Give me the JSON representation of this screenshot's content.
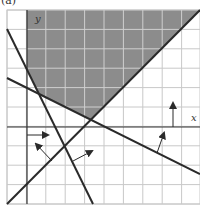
{
  "figure": {
    "panel_label": "(a)",
    "x_axis_label": "x",
    "y_axis_label": "y"
  },
  "colors": {
    "shade": "#8c8c8c",
    "grid_on_shade": "#cfcfcf",
    "grid": "#c8c8c8",
    "axis": "#333333",
    "line": "#2a2a2a"
  },
  "grid": {
    "x0": 7,
    "y0": 10,
    "x1": 200,
    "y1": 204,
    "step": 19.4,
    "axis_x_pixel": 27,
    "axis_y_pixel": 127
  },
  "shaded_region": [
    [
      27,
      10
    ],
    [
      200,
      10
    ],
    [
      90.9,
      119.7
    ],
    [
      38.9,
      93.9
    ],
    [
      27,
      69.7
    ]
  ],
  "lines": [
    {
      "name": "steep-descending-line",
      "from": [
        7,
        29
      ],
      "to": [
        93,
        204
      ]
    },
    {
      "name": "shallow-descending-line",
      "from": [
        7,
        78
      ],
      "to": [
        200,
        174
      ]
    },
    {
      "name": "ascending-diagonal-line",
      "from": [
        7,
        204
      ],
      "to": [
        200,
        10
      ]
    }
  ],
  "arrows": [
    {
      "name": "arrow-right-from-y-axis",
      "from": [
        27,
        135
      ],
      "to": [
        48,
        135
      ]
    },
    {
      "name": "arrow-up-from-x-axis",
      "from": [
        173,
        127
      ],
      "to": [
        173,
        103
      ]
    },
    {
      "name": "arrow-normal-steep-line",
      "from": [
        52,
        161
      ],
      "to": [
        36,
        144
      ]
    },
    {
      "name": "arrow-normal-diagonal-line",
      "from": [
        73,
        161
      ],
      "to": [
        92,
        151
      ]
    },
    {
      "name": "arrow-normal-shallow-line",
      "from": [
        157,
        153
      ],
      "to": [
        164,
        133
      ]
    }
  ]
}
